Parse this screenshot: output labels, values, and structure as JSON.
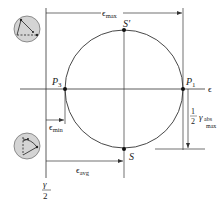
{
  "diagram": {
    "axes": {
      "horizontal_label": "ϵ",
      "vertical_label_num": "γ",
      "vertical_label_den": "2"
    },
    "points": [
      {
        "id": "P1",
        "letter": "P",
        "sub": "1"
      },
      {
        "id": "P3",
        "letter": "P",
        "sub": "3"
      },
      {
        "id": "S",
        "letter": "S",
        "sub": ""
      },
      {
        "id": "S_prime",
        "letter": "S′",
        "sub": ""
      }
    ],
    "dimensions": {
      "eps_max": {
        "symbol": "ϵ",
        "sub": "max"
      },
      "eps_min": {
        "symbol": "ϵ",
        "sub": "min"
      },
      "eps_avg": {
        "symbol": "ϵ",
        "sub": "avg"
      },
      "half_gamma_abs_max": {
        "frac_num": "1",
        "frac_den": "2",
        "symbol": "γ",
        "sub_top": "abs",
        "sub_bottom": "max"
      }
    },
    "insets": [
      {
        "name": "element-deformed-top",
        "description": "strain element diagram with right-angle triangle"
      },
      {
        "name": "element-deformed-bottom",
        "description": "strain element diagram rotated"
      }
    ],
    "colors": {
      "line": "#333333",
      "inset_fill": "#d4d4d4",
      "inset_stroke": "#666666"
    }
  }
}
